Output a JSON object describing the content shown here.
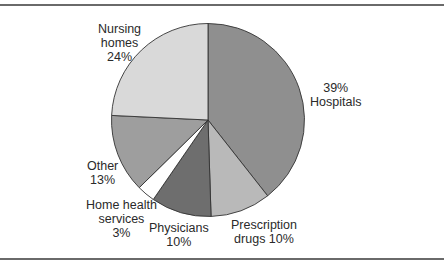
{
  "chart_data": {
    "type": "pie",
    "title": "",
    "slices": [
      {
        "name": "Hospitals",
        "value": 39,
        "label_lines": [
          "39%",
          "Hospitals"
        ],
        "color": "#8f8f8f"
      },
      {
        "name": "Prescription drugs",
        "value": 10,
        "label_lines": [
          "Prescription",
          "drugs 10%"
        ],
        "color": "#b9b9b9"
      },
      {
        "name": "Physicians",
        "value": 10,
        "label_lines": [
          "Physicians",
          "10%"
        ],
        "color": "#6e6e6e"
      },
      {
        "name": "Home health services",
        "value": 3,
        "label_lines": [
          "Home health",
          "services",
          "3%"
        ],
        "color": "#ffffff"
      },
      {
        "name": "Other",
        "value": 13,
        "label_lines": [
          "Other",
          "13%"
        ],
        "color": "#9e9e9e"
      },
      {
        "name": "Nursing homes",
        "value": 24,
        "label_lines": [
          "Nursing",
          "homes",
          "24%"
        ],
        "color": "#d9d9d9"
      }
    ],
    "start_angle_deg": 0,
    "direction": "clockwise",
    "legend": "none",
    "units": "%"
  },
  "labels": {
    "hospitals": {
      "l1": "39%",
      "l2": "Hospitals"
    },
    "prescription": {
      "l1": "Prescription",
      "l2": "drugs 10%"
    },
    "physicians": {
      "l1": "Physicians",
      "l2": "10%"
    },
    "home_health": {
      "l1": "Home health",
      "l2": "services",
      "l3": "3%"
    },
    "other": {
      "l1": "Other",
      "l2": "13%"
    },
    "nursing": {
      "l1": "Nursing",
      "l2": "homes",
      "l3": "24%"
    }
  }
}
